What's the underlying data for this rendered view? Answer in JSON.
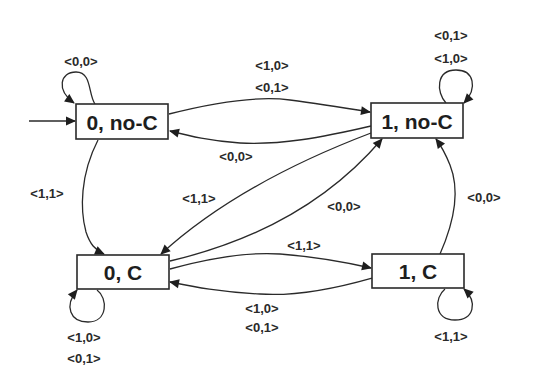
{
  "diagram": {
    "type": "state-machine",
    "colors": {
      "stroke": "#2a2a2a",
      "text": "#1e1e1e",
      "background": "#ffffff"
    },
    "states": [
      {
        "id": "s0noC",
        "label": "0, no-C",
        "initial": true
      },
      {
        "id": "s1noC",
        "label": "1, no-C"
      },
      {
        "id": "s0C",
        "label": "0, C"
      },
      {
        "id": "s1C",
        "label": "1, C"
      }
    ],
    "transitions": [
      {
        "from": "0, no-C",
        "to": "0, no-C",
        "labels": [
          "<0,0>"
        ]
      },
      {
        "from": "0, no-C",
        "to": "1, no-C",
        "labels": [
          "<1,0>",
          "<0,1>"
        ]
      },
      {
        "from": "1, no-C",
        "to": "0, no-C",
        "labels": [
          "<0,0>"
        ]
      },
      {
        "from": "0, no-C",
        "to": "0, C",
        "labels": [
          "<1,1>"
        ]
      },
      {
        "from": "1, no-C",
        "to": "0, C",
        "labels": [
          "<1,1>"
        ]
      },
      {
        "from": "0, C",
        "to": "1, no-C",
        "labels": [
          "<0,0>"
        ]
      },
      {
        "from": "0, C",
        "to": "1, C",
        "labels": [
          "<1,1>"
        ]
      },
      {
        "from": "1, C",
        "to": "0, C",
        "labels": [
          "<1,0>",
          "<0,1>"
        ]
      },
      {
        "from": "1, C",
        "to": "1, no-C",
        "labels": [
          "<0,0>"
        ]
      },
      {
        "from": "1, no-C",
        "to": "1, no-C",
        "labels": [
          "<0,1>",
          "<1,0>"
        ]
      },
      {
        "from": "0, C",
        "to": "0, C",
        "labels": [
          "<1,0>",
          "<0,1>"
        ]
      },
      {
        "from": "1, C",
        "to": "1, C",
        "labels": [
          "<1,1>"
        ]
      }
    ],
    "labels": {
      "loop_0noC": "<0,0>",
      "e_0noC_1noC_a": "<1,0>",
      "e_0noC_1noC_b": "<0,1>",
      "e_1noC_0noC": "<0,0>",
      "e_0noC_0C": "<1,1>",
      "e_1noC_0C": "<1,1>",
      "e_0C_1noC": "<0,0>",
      "e_0C_1C": "<1,1>",
      "e_1C_0C_a": "<1,0>",
      "e_1C_0C_b": "<0,1>",
      "e_1C_1noC": "<0,0>",
      "loop_1noC_a": "<0,1>",
      "loop_1noC_b": "<1,0>",
      "loop_0C_a": "<1,0>",
      "loop_0C_b": "<0,1>",
      "loop_1C": "<1,1>"
    }
  }
}
